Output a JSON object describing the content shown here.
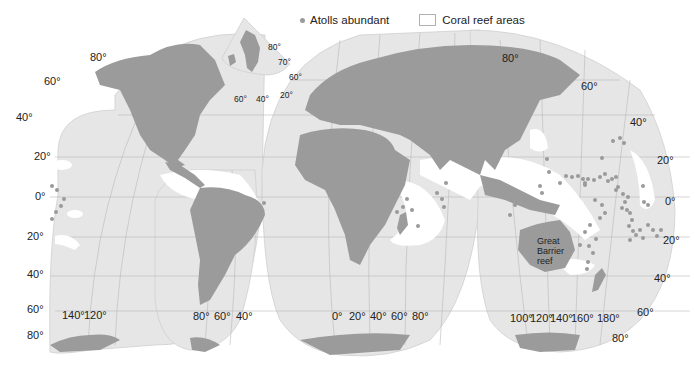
{
  "legend": {
    "atolls_label": "Atolls abundant",
    "coral_label": "Coral reef areas",
    "colors": {
      "atoll_dot": "#9a9a9a",
      "coral_area": "#ffffff"
    }
  },
  "colors": {
    "ocean": "#e6e6e6",
    "land": "#9b9b9b",
    "graticule": "#b4b4b4",
    "coral": "#ffffff"
  },
  "inset": {
    "title": "Greenland inset",
    "labels": {
      "lat80": "80°",
      "lat70": "70°",
      "lat60": "60°",
      "lon20": "20°",
      "lon40": "40°",
      "lon60": "60°"
    }
  },
  "lobes": {
    "north_america_pacific": {
      "lat_labels": {
        "n80": "80°",
        "n60": "60°",
        "n40": "40°",
        "n20": "20°",
        "eq": "0°",
        "s20": "20°",
        "s40": "40°",
        "s60": "60°",
        "s80": "80°"
      },
      "lon_labels": {
        "w140": "140°",
        "w120": "120°"
      }
    },
    "south_america": {
      "lon_labels": {
        "w80": "80°",
        "w60": "60°",
        "w40": "40°"
      }
    },
    "europe_africa": {
      "lon_labels": {
        "e0": "0°",
        "e20": "20°",
        "e40": "40°",
        "e60": "60°",
        "e80": "80°"
      }
    },
    "asia_pacific": {
      "lat_labels": {
        "n80": "80°",
        "n60": "60°",
        "n40": "40°",
        "n20": "20°",
        "eq": "0°",
        "s20": "20°",
        "s40": "40°",
        "s60": "60°",
        "s80": "80°"
      },
      "lon_labels": {
        "e100": "100°",
        "e120": "120°",
        "e140": "140°",
        "e160": "160°",
        "e180": "180°"
      }
    }
  },
  "annotations": {
    "great_barrier_reef": [
      "Great",
      "Barrier",
      "reef"
    ]
  }
}
